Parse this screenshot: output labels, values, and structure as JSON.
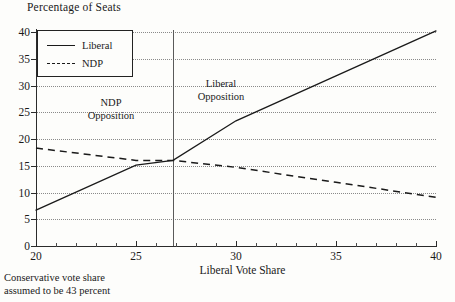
{
  "chart_data": {
    "type": "line",
    "title": "Percentage of Seats",
    "xlabel": "Liberal Vote Share",
    "ylabel": "Percentage of Seats",
    "xlim": [
      20,
      40
    ],
    "ylim": [
      0,
      40
    ],
    "xticks": [
      20,
      25,
      30,
      35,
      40
    ],
    "xtick_labels": [
      "20",
      "25",
      "30",
      "35",
      "40"
    ],
    "yticks": [
      0,
      5,
      10,
      15,
      20,
      25,
      30,
      35,
      40
    ],
    "ytick_labels": [
      "0",
      "5",
      "10",
      "15",
      "20",
      "25",
      "30",
      "35",
      "40"
    ],
    "grid": "horizontal-dotted",
    "legend_position": "top-left",
    "series": [
      {
        "name": "Liberal",
        "style": "solid",
        "color": "#1a1a1a",
        "x": [
          20,
          25,
          26.85,
          30,
          35,
          40
        ],
        "values": [
          6.7,
          15.1,
          16.0,
          23.4,
          31.8,
          40.2
        ]
      },
      {
        "name": "NDP",
        "style": "dashed",
        "color": "#1a1a1a",
        "x": [
          20,
          25,
          26.85,
          30,
          35,
          40
        ],
        "values": [
          18.3,
          16.0,
          16.0,
          14.7,
          11.9,
          9.1
        ]
      }
    ],
    "reference_lines": [
      {
        "name": "crossover",
        "orientation": "vertical",
        "x": 26.85
      }
    ],
    "annotations": [
      {
        "name": "ndp-opposition",
        "line1": "NDP",
        "line2": "Opposition",
        "x": 23.1,
        "y": 26.5
      },
      {
        "name": "liberal-opposition",
        "line1": "Liberal",
        "line2": "Opposition",
        "x": 31.0,
        "y": 30.0
      }
    ],
    "footnote_line1": "Conservative vote share",
    "footnote_line2": "assumed to be 43 percent"
  },
  "legend": {
    "items": [
      {
        "label": "Liberal",
        "style": "solid"
      },
      {
        "label": "NDP",
        "style": "dashed"
      }
    ]
  }
}
